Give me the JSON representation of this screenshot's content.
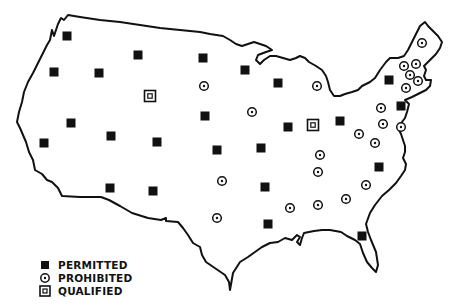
{
  "map": {
    "title": "",
    "region": "Contiguous United States",
    "outline_color": "#111111",
    "marker_color": "#111111"
  },
  "legend": {
    "items": [
      {
        "key": "permitted",
        "label": "PERMITTED",
        "symbol": "filled-square"
      },
      {
        "key": "prohibited",
        "label": "PROHIBITED",
        "symbol": "dotted-circle"
      },
      {
        "key": "qualified",
        "label": "QUALIFIED",
        "symbol": "double-square"
      }
    ]
  },
  "markers": [
    {
      "state": "WA",
      "type": "permitted",
      "x": 67,
      "y": 36
    },
    {
      "state": "OR",
      "type": "permitted",
      "x": 54,
      "y": 72
    },
    {
      "state": "ID",
      "type": "permitted",
      "x": 99,
      "y": 73
    },
    {
      "state": "MT",
      "type": "permitted",
      "x": 138,
      "y": 55
    },
    {
      "state": "WY",
      "type": "qualified",
      "x": 150,
      "y": 96
    },
    {
      "state": "NV",
      "type": "permitted",
      "x": 71,
      "y": 123
    },
    {
      "state": "CA",
      "type": "permitted",
      "x": 44,
      "y": 143
    },
    {
      "state": "UT",
      "type": "permitted",
      "x": 111,
      "y": 136
    },
    {
      "state": "CO",
      "type": "permitted",
      "x": 157,
      "y": 142
    },
    {
      "state": "AZ",
      "type": "permitted",
      "x": 110,
      "y": 188
    },
    {
      "state": "NM",
      "type": "permitted",
      "x": 153,
      "y": 191
    },
    {
      "state": "ND",
      "type": "permitted",
      "x": 203,
      "y": 58
    },
    {
      "state": "SD",
      "type": "prohibited",
      "x": 204,
      "y": 86
    },
    {
      "state": "NE",
      "type": "permitted",
      "x": 205,
      "y": 116
    },
    {
      "state": "KS",
      "type": "permitted",
      "x": 217,
      "y": 150
    },
    {
      "state": "OK",
      "type": "prohibited",
      "x": 222,
      "y": 181
    },
    {
      "state": "TX",
      "type": "prohibited",
      "x": 217,
      "y": 218
    },
    {
      "state": "MN",
      "type": "permitted",
      "x": 245,
      "y": 70
    },
    {
      "state": "IA",
      "type": "prohibited",
      "x": 252,
      "y": 112
    },
    {
      "state": "MO",
      "type": "permitted",
      "x": 261,
      "y": 148
    },
    {
      "state": "AR",
      "type": "permitted",
      "x": 265,
      "y": 187
    },
    {
      "state": "LA",
      "type": "permitted",
      "x": 268,
      "y": 224
    },
    {
      "state": "WI",
      "type": "permitted",
      "x": 278,
      "y": 83
    },
    {
      "state": "IL",
      "type": "permitted",
      "x": 288,
      "y": 127
    },
    {
      "state": "MI",
      "type": "prohibited",
      "x": 317,
      "y": 86
    },
    {
      "state": "IN",
      "type": "qualified",
      "x": 313,
      "y": 125
    },
    {
      "state": "OH",
      "type": "permitted",
      "x": 340,
      "y": 121
    },
    {
      "state": "KY",
      "type": "prohibited",
      "x": 320,
      "y": 155
    },
    {
      "state": "TN",
      "type": "prohibited",
      "x": 318,
      "y": 172
    },
    {
      "state": "MS",
      "type": "prohibited",
      "x": 290,
      "y": 208
    },
    {
      "state": "AL",
      "type": "prohibited",
      "x": 318,
      "y": 205
    },
    {
      "state": "GA",
      "type": "prohibited",
      "x": 346,
      "y": 199
    },
    {
      "state": "FL",
      "type": "permitted",
      "x": 362,
      "y": 236
    },
    {
      "state": "SC",
      "type": "prohibited",
      "x": 366,
      "y": 185
    },
    {
      "state": "NC",
      "type": "permitted",
      "x": 379,
      "y": 167
    },
    {
      "state": "VA",
      "type": "prohibited",
      "x": 375,
      "y": 143
    },
    {
      "state": "WV",
      "type": "prohibited",
      "x": 359,
      "y": 134
    },
    {
      "state": "MD",
      "type": "prohibited",
      "x": 383,
      "y": 124
    },
    {
      "state": "DE",
      "type": "prohibited",
      "x": 401,
      "y": 127
    },
    {
      "state": "PA",
      "type": "prohibited",
      "x": 381,
      "y": 108
    },
    {
      "state": "NJ",
      "type": "permitted",
      "x": 401,
      "y": 106
    },
    {
      "state": "NY",
      "type": "permitted",
      "x": 389,
      "y": 80
    },
    {
      "state": "CT",
      "type": "prohibited",
      "x": 406,
      "y": 88
    },
    {
      "state": "VT",
      "type": "prohibited",
      "x": 404,
      "y": 66
    },
    {
      "state": "NH",
      "type": "prohibited",
      "x": 416,
      "y": 64
    },
    {
      "state": "MA",
      "type": "prohibited",
      "x": 410,
      "y": 75
    },
    {
      "state": "RI",
      "type": "prohibited",
      "x": 418,
      "y": 81
    },
    {
      "state": "ME",
      "type": "prohibited",
      "x": 422,
      "y": 43
    }
  ]
}
